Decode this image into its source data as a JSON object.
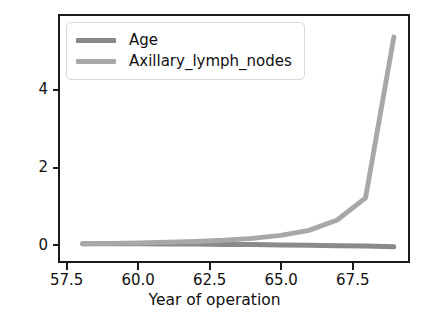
{
  "chart_data": {
    "type": "line",
    "title": "",
    "xlabel": "Year of operation",
    "ylabel": "Cummulative variance",
    "xlim": [
      57.2,
      69.5
    ],
    "ylim": [
      -0.45,
      5.95
    ],
    "xticks": [
      "57.5",
      "60.0",
      "62.5",
      "65.0",
      "67.5"
    ],
    "xtick_values": [
      57.5,
      60.0,
      62.5,
      65.0,
      67.5
    ],
    "yticks": [
      "0",
      "2",
      "4"
    ],
    "ytick_values": [
      0,
      2,
      4
    ],
    "grid": false,
    "legend_position": "upper left",
    "x": [
      58,
      59,
      60,
      61,
      62,
      63,
      64,
      65,
      66,
      67,
      68,
      69
    ],
    "series": [
      {
        "name": "Age",
        "color": "#8a8a8a",
        "values": [
          0.0,
          0.0,
          0.0,
          -0.01,
          -0.01,
          -0.02,
          -0.02,
          -0.03,
          -0.04,
          -0.05,
          -0.06,
          -0.08
        ]
      },
      {
        "name": "Axillary_lymph_nodes",
        "color": "#a8a8a8",
        "values": [
          0.0,
          0.01,
          0.02,
          0.04,
          0.06,
          0.09,
          0.14,
          0.22,
          0.35,
          0.62,
          1.2,
          5.4
        ]
      }
    ]
  },
  "legend": {
    "items": [
      {
        "label": "Age",
        "color": "#8a8a8a"
      },
      {
        "label": "Axillary_lymph_nodes",
        "color": "#a8a8a8"
      }
    ]
  },
  "style": {
    "background": "#ffffff",
    "axis_color": "#1b1b1b",
    "text_color": "#111111",
    "legend_border": "#d8d8d8"
  }
}
